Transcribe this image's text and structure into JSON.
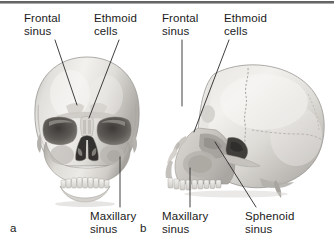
{
  "figure": {
    "background_color": "#ffffff",
    "text_color": "#1b1b1b",
    "rule_color": "#5d5d5d"
  },
  "panels": [
    {
      "id": "a",
      "mark": "a",
      "view": "anterior-skull",
      "labels": [
        {
          "id": "frontal-sinus",
          "text": "Frontal\nsinus"
        },
        {
          "id": "ethmoid-cells",
          "text": "Ethmoid\ncells"
        },
        {
          "id": "maxillary-sinus",
          "text": "Maxillary\nsinus"
        }
      ]
    },
    {
      "id": "b",
      "mark": "b",
      "view": "lateral-skull",
      "labels": [
        {
          "id": "frontal-sinus",
          "text": "Frontal\nsinus"
        },
        {
          "id": "ethmoid-cells",
          "text": "Ethmoid\ncells"
        },
        {
          "id": "maxillary-sinus",
          "text": "Maxillary\nsinus"
        },
        {
          "id": "sphenoid-sinus",
          "text": "Sphenoid\nsinus"
        }
      ]
    }
  ],
  "labels_flat": {
    "a_frontal": "Frontal\nsinus",
    "a_ethmoid": "Ethmoid\ncells",
    "a_maxillary": "Maxillary\nsinus",
    "a_mark": "a",
    "b_frontal": "Frontal\nsinus",
    "b_ethmoid": "Ethmoid\ncells",
    "b_maxillary": "Maxillary\nsinus",
    "b_sphenoid": "Sphenoid\nsinus",
    "b_mark": "b"
  }
}
